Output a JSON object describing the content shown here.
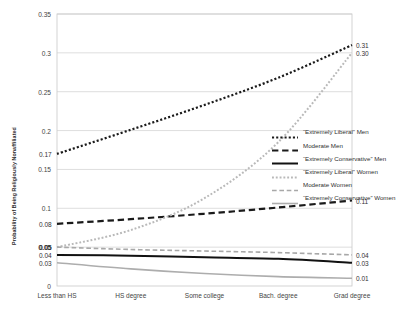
{
  "chart_data": {
    "type": "line",
    "title": "",
    "xlabel": "",
    "ylabel": "Probability of Being Religiously Nonaffiliated",
    "categories": [
      "Less than HS",
      "HS degree",
      "Some college",
      "Bach. degree",
      "Grad degree"
    ],
    "ylim": [
      0,
      0.35
    ],
    "yticks": [
      "0",
      "0.05",
      "0.1",
      "0.15",
      "0.2",
      "0.25",
      "0.3",
      "0.35"
    ],
    "ytick_values": [
      0,
      0.05,
      0.1,
      0.15,
      0.2,
      0.25,
      0.3,
      0.35
    ],
    "grid": true,
    "legend_position": "right-middle",
    "series": [
      {
        "name": "“Extremely Liberal” Men",
        "style": "dotted",
        "color": "#1a1a1a",
        "width": 2.2,
        "values": [
          0.17,
          0.201,
          0.233,
          0.268,
          0.31
        ],
        "start_label": "0.17",
        "end_label": "0.31"
      },
      {
        "name": "Moderate Men",
        "style": "dashed",
        "color": "#1a1a1a",
        "width": 2.2,
        "values": [
          0.08,
          0.086,
          0.093,
          0.101,
          0.11
        ],
        "start_label": "0.08",
        "end_label": "0.11"
      },
      {
        "name": "“Extremely Conservative” Men",
        "style": "solid",
        "color": "#111111",
        "width": 2.0,
        "values": [
          0.04,
          0.039,
          0.037,
          0.035,
          0.03
        ],
        "start_label": "0.04",
        "end_label": "0.03"
      },
      {
        "name": "“Extremely Liberal” Women",
        "style": "dotted",
        "color": "#b9b9b9",
        "width": 2.0,
        "values": [
          0.05,
          0.072,
          0.113,
          0.185,
          0.3
        ],
        "start_label": "0.05",
        "end_label": "0.30"
      },
      {
        "name": "Moderate Women",
        "style": "dashed",
        "color": "#a8a8a8",
        "width": 1.6,
        "values": [
          0.05,
          0.047,
          0.045,
          0.043,
          0.04
        ],
        "start_label": "0.05",
        "end_label": "0.04"
      },
      {
        "name": "“Extremely Conservative” Women",
        "style": "solid",
        "color": "#adadad",
        "width": 1.6,
        "values": [
          0.03,
          0.022,
          0.016,
          0.012,
          0.01
        ],
        "start_label": "0.03",
        "end_label": "0.01"
      }
    ]
  }
}
